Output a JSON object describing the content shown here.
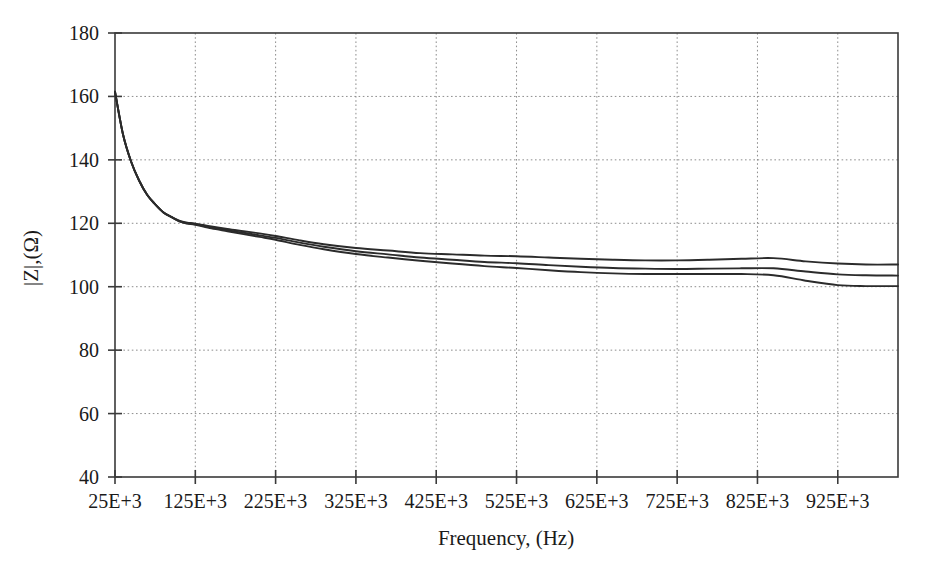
{
  "chart_data": {
    "type": "line",
    "title": "",
    "xlabel": "Frequency, (Hz)",
    "ylabel": "|Z|,(Ω)",
    "xlim": [
      25000,
      1000000
    ],
    "ylim": [
      40,
      180
    ],
    "grid": true,
    "legend": null,
    "x_tick_labels": [
      "25E+3",
      "125E+3",
      "225E+3",
      "325E+3",
      "425E+3",
      "525E+3",
      "625E+3",
      "725E+3",
      "825E+3",
      "925E+3"
    ],
    "x_tick_values": [
      25000,
      125000,
      225000,
      325000,
      425000,
      525000,
      625000,
      725000,
      825000,
      925000
    ],
    "y_tick_labels": [
      "40",
      "60",
      "80",
      "100",
      "120",
      "140",
      "160",
      "180"
    ],
    "y_tick_values": [
      40,
      60,
      80,
      100,
      120,
      140,
      160,
      180
    ],
    "x": [
      25000,
      35000,
      45000,
      55000,
      65000,
      75000,
      85000,
      95000,
      105000,
      115000,
      125000,
      145000,
      165000,
      185000,
      205000,
      225000,
      255000,
      285000,
      325000,
      365000,
      405000,
      445000,
      485000,
      525000,
      565000,
      605000,
      645000,
      685000,
      725000,
      765000,
      805000,
      845000,
      885000,
      925000,
      960000,
      1000000
    ],
    "series": [
      {
        "name": "trace-1",
        "values": [
          161.5,
          148.0,
          139.5,
          133.5,
          129.0,
          126.0,
          123.5,
          122.0,
          120.8,
          120.2,
          119.9,
          119.0,
          118.2,
          117.5,
          116.8,
          116.0,
          114.6,
          113.4,
          112.2,
          111.4,
          110.6,
          110.2,
          109.8,
          109.6,
          109.2,
          108.8,
          108.5,
          108.3,
          108.3,
          108.5,
          108.8,
          109.0,
          108.0,
          107.3,
          107.0,
          107.0
        ]
      },
      {
        "name": "trace-2",
        "values": [
          161.5,
          148.0,
          139.5,
          133.5,
          129.0,
          126.0,
          123.5,
          122.0,
          120.7,
          120.0,
          119.7,
          118.7,
          117.8,
          117.0,
          116.2,
          115.4,
          113.9,
          112.6,
          111.2,
          110.2,
          109.2,
          108.5,
          107.8,
          107.4,
          106.8,
          106.3,
          105.9,
          105.7,
          105.6,
          105.7,
          105.8,
          105.8,
          104.8,
          103.9,
          103.6,
          103.5
        ]
      },
      {
        "name": "trace-3",
        "values": [
          161.5,
          148.0,
          139.5,
          133.5,
          129.0,
          126.0,
          123.5,
          122.0,
          120.6,
          119.9,
          119.5,
          118.4,
          117.5,
          116.6,
          115.7,
          114.8,
          113.2,
          111.8,
          110.3,
          109.2,
          108.2,
          107.3,
          106.5,
          105.9,
          105.2,
          104.6,
          104.2,
          104.0,
          104.0,
          104.0,
          104.0,
          103.6,
          101.9,
          100.5,
          100.2,
          100.2
        ]
      }
    ]
  },
  "geometry": {
    "plot_left": 115,
    "plot_right": 898,
    "plot_top": 33,
    "plot_bottom": 477
  }
}
